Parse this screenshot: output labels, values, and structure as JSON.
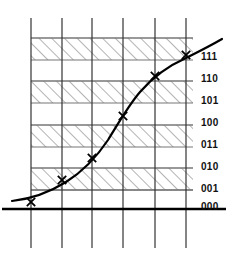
{
  "figure": {
    "title": "",
    "background_color": "#ffffff",
    "axis_color": "#000000",
    "grid_color": "#555555",
    "band_color": "#777777",
    "hatch_color": "#666666",
    "curve_color": "#000000",
    "marker_color": "#000000",
    "marker_glyph": "x"
  },
  "level_labels": [
    {
      "code": "111",
      "y": 57,
      "band": "hatched"
    },
    {
      "code": "110",
      "y": 79,
      "band": "plain"
    },
    {
      "code": "101",
      "y": 101,
      "band": "hatched"
    },
    {
      "code": "100",
      "y": 123,
      "band": "plain"
    },
    {
      "code": "011",
      "y": 145,
      "band": "hatched"
    },
    {
      "code": "010",
      "y": 167,
      "band": "plain"
    },
    {
      "code": "001",
      "y": 189,
      "band": "hatched"
    },
    {
      "code": "000",
      "y": 207,
      "band": "plain"
    }
  ],
  "chart_data": {
    "type": "line",
    "title": "",
    "xlabel": "",
    "ylabel": "",
    "x": [
      31,
      62,
      92,
      123,
      155,
      186
    ],
    "values": [
      202,
      180,
      158,
      116,
      76,
      55
    ],
    "sample_codes": [
      "000",
      "001",
      "010",
      "100",
      "110",
      "111"
    ],
    "ylim": [
      209,
      31
    ],
    "xlim": [
      10,
      225
    ],
    "grid": true,
    "legend": "none",
    "series": [
      {
        "name": "signal",
        "kind": "curve",
        "path": "M 12,201 C 30,199 50,192 66,182 C 82,172 96,158 108,140 C 118,124 128,106 140,92 C 152,78 168,66 186,58 C 198,52 210,46 222,39"
      },
      {
        "name": "samples",
        "kind": "markers",
        "points": [
          {
            "x": 31,
            "y": 202,
            "code": "000"
          },
          {
            "x": 62,
            "y": 180,
            "code": "001"
          },
          {
            "x": 92,
            "y": 158,
            "code": "010"
          },
          {
            "x": 123,
            "y": 116,
            "code": "100"
          },
          {
            "x": 155,
            "y": 76,
            "code": "110"
          },
          {
            "x": 186,
            "y": 55,
            "code": "111"
          }
        ]
      }
    ],
    "vertical_gridlines": [
      31,
      62,
      92,
      123,
      155,
      186
    ],
    "horizontal_bands": [
      {
        "code": "111",
        "top": 38,
        "bottom": 60,
        "hatched": true
      },
      {
        "code": "110",
        "top": 60,
        "bottom": 81,
        "hatched": false
      },
      {
        "code": "101",
        "top": 81,
        "bottom": 103,
        "hatched": true
      },
      {
        "code": "100",
        "top": 103,
        "bottom": 125,
        "hatched": false
      },
      {
        "code": "011",
        "top": 125,
        "bottom": 147,
        "hatched": true
      },
      {
        "code": "010",
        "top": 147,
        "bottom": 168,
        "hatched": false
      },
      {
        "code": "001",
        "top": 168,
        "bottom": 190,
        "hatched": true
      },
      {
        "code": "000",
        "top": 190,
        "bottom": 209,
        "hatched": false
      }
    ],
    "baseline_y": 209,
    "plot_left": 31,
    "plot_right": 193
  }
}
